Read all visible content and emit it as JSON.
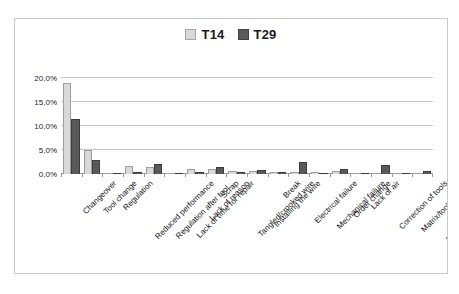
{
  "legend": {
    "position": "top-center",
    "entries": [
      {
        "label": "T14",
        "color": "#d9d9d9"
      },
      {
        "label": "T29",
        "color": "#595959"
      }
    ]
  },
  "axis": {
    "yticks": [
      "0,0%",
      "5,0%",
      "10,0%",
      "15,0%",
      "20,0%"
    ]
  },
  "chart_data": {
    "type": "bar",
    "title": "",
    "xlabel": "",
    "ylabel": "",
    "ylim": [
      0,
      20
    ],
    "ytick_values": [
      0,
      5,
      10,
      15,
      20
    ],
    "ytick_labels": [
      "0,0%",
      "5,0%",
      "10,0%",
      "15,0%",
      "20,0%"
    ],
    "grid": true,
    "legend_position": "top-center",
    "value_unit": "percent",
    "categories": [
      "Changeover",
      "Tool change",
      "Regulation",
      "Reduced performance",
      "Regulation after tool...",
      "Lack of time for repair",
      "Lack of reason",
      "Scrap",
      "Tangled/crooked wire",
      "Installing the wire",
      "Break",
      "Electrical failure",
      "Mechanical failure",
      "Order change",
      "Lack of air",
      "Correction of tools",
      "Matrix/tool cleaning",
      "Break - work on other..."
    ],
    "series": [
      {
        "name": "T14",
        "color": "#d9d9d9",
        "values": [
          19.0,
          5.0,
          0.3,
          1.6,
          1.4,
          0.2,
          1.0,
          1.0,
          0.7,
          0.6,
          0.5,
          0.4,
          0.4,
          0.6,
          0.2,
          0.2,
          0.1,
          0.2
        ]
      },
      {
        "name": "T29",
        "color": "#595959",
        "values": [
          11.5,
          3.0,
          0.2,
          0.4,
          2.1,
          0.2,
          0.4,
          1.4,
          0.4,
          0.9,
          0.4,
          2.4,
          0.2,
          1.0,
          0.2,
          1.9,
          0.2,
          0.7
        ]
      }
    ]
  }
}
